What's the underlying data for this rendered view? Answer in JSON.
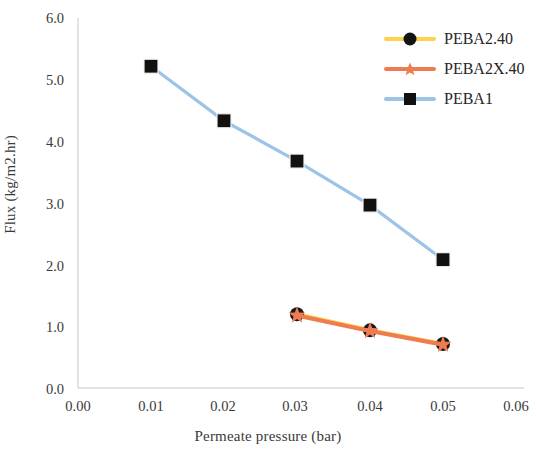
{
  "chart_data": {
    "type": "line",
    "title": "",
    "xlabel": "Permeate pressure (bar)",
    "ylabel": "Flux (kg/m2.hr)",
    "xlim": [
      0.0,
      0.06
    ],
    "ylim": [
      0.0,
      6.0
    ],
    "xticks": [
      "0.00",
      "0.01",
      "0.02",
      "0.03",
      "0.04",
      "0.05",
      "0.06"
    ],
    "yticks": [
      "0.0",
      "1.0",
      "2.0",
      "3.0",
      "4.0",
      "5.0",
      "6.0"
    ],
    "grid": false,
    "legend_position": "top-right",
    "series": [
      {
        "name": "PEBA2.40",
        "color": "#FFD24D",
        "marker": "circle",
        "marker_color": "#1a1a1a",
        "x": [
          0.03,
          0.04,
          0.05
        ],
        "values": [
          1.19,
          0.93,
          0.71
        ]
      },
      {
        "name": "PEBA2X.40",
        "color": "#ED7D50",
        "marker": "star",
        "marker_color": "#ED7D50",
        "x": [
          0.03,
          0.04,
          0.05
        ],
        "values": [
          1.17,
          0.92,
          0.7
        ]
      },
      {
        "name": "PEBA1",
        "color": "#9DC3E6",
        "marker": "square",
        "marker_color": "#111111",
        "x": [
          0.01,
          0.02,
          0.03,
          0.04,
          0.05
        ],
        "values": [
          5.19,
          4.31,
          3.66,
          2.95,
          2.07
        ]
      }
    ]
  },
  "legend": {
    "items": [
      {
        "label": "PEBA2.40"
      },
      {
        "label": "PEBA2X.40"
      },
      {
        "label": "PEBA1"
      }
    ]
  },
  "axes": {
    "x_title": "Permeate pressure (bar)",
    "y_title": "Flux (kg/m2.hr)",
    "x_tick_0": "0.00",
    "x_tick_1": "0.01",
    "x_tick_2": "0.02",
    "x_tick_3": "0.03",
    "x_tick_4": "0.04",
    "x_tick_5": "0.05",
    "x_tick_6": "0.06",
    "y_tick_0": "0.0",
    "y_tick_1": "1.0",
    "y_tick_2": "2.0",
    "y_tick_3": "3.0",
    "y_tick_4": "4.0",
    "y_tick_5": "5.0",
    "y_tick_6": "6.0"
  }
}
